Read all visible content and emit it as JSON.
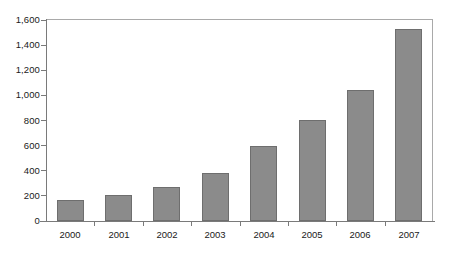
{
  "chart_data": {
    "type": "bar",
    "title": "",
    "subtitle": "",
    "xlabel": "",
    "ylabel": "",
    "categories": [
      "2000",
      "2001",
      "2002",
      "2003",
      "2004",
      "2005",
      "2006",
      "2007"
    ],
    "values": [
      165,
      205,
      270,
      385,
      600,
      805,
      1040,
      1530
    ],
    "series": [
      {
        "name": "",
        "values": [
          165,
          205,
          270,
          385,
          600,
          805,
          1040,
          1530
        ]
      }
    ],
    "ylim": [
      0,
      1600
    ],
    "xlim": [
      0,
      8
    ],
    "y_ticks": [
      0,
      200,
      400,
      600,
      800,
      1000,
      1200,
      1400,
      1600
    ],
    "y_tick_labels": [
      "0",
      "200",
      "400",
      "600",
      "800",
      "1,000",
      "1,200",
      "1,400",
      "1,600"
    ],
    "x_tick_labels": [
      "2000",
      "2001",
      "2002",
      "2003",
      "2004",
      "2005",
      "2006",
      "2007"
    ],
    "grid": false,
    "legend": false,
    "legend_position": "none",
    "annotations": [],
    "colors": {
      "bar_fill": "#8b8b8b",
      "bar_border": "#6e6e6e",
      "axis": "#7a7a7a",
      "frame": "#a9a9a9",
      "text": "#1a1a1a",
      "background": "#ffffff"
    }
  }
}
